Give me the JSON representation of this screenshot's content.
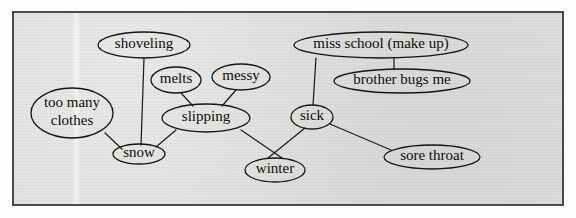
{
  "document": {
    "type": "concept-map",
    "title": "snow concept map",
    "background_color": "#dededc",
    "frame_color": "#4a4a48",
    "ink_color": "#141414"
  },
  "nodes": [
    {
      "id": "shoveling",
      "label": "shoveling",
      "cx": 144,
      "cy": 45,
      "rx": 46,
      "ry": 13,
      "font_size": 15
    },
    {
      "id": "melts",
      "label": "melts",
      "cx": 176,
      "cy": 80,
      "rx": 25,
      "ry": 13,
      "font_size": 15
    },
    {
      "id": "messy",
      "label": "messy",
      "cx": 241,
      "cy": 77,
      "rx": 29,
      "ry": 13,
      "font_size": 15
    },
    {
      "id": "too-many-clothes",
      "label": "too many clothes",
      "cx": 72,
      "cy": 113,
      "rx": 41,
      "ry": 25,
      "font_size": 15
    },
    {
      "id": "slipping",
      "label": "slipping",
      "cx": 206,
      "cy": 118,
      "rx": 44,
      "ry": 14,
      "font_size": 15
    },
    {
      "id": "snow",
      "label": "snow",
      "cx": 139,
      "cy": 154,
      "rx": 26,
      "ry": 10,
      "font_size": 15
    },
    {
      "id": "winter",
      "label": "winter",
      "cx": 275,
      "cy": 170,
      "rx": 30,
      "ry": 12,
      "font_size": 15
    },
    {
      "id": "miss-school",
      "label": "miss school (make up)",
      "cx": 381,
      "cy": 45,
      "rx": 87,
      "ry": 13,
      "font_size": 15
    },
    {
      "id": "brother-bugs-me",
      "label": "brother bugs me",
      "cx": 402,
      "cy": 81,
      "rx": 68,
      "ry": 12,
      "font_size": 15
    },
    {
      "id": "sick",
      "label": "sick",
      "cx": 312,
      "cy": 117,
      "rx": 21,
      "ry": 12,
      "font_size": 15
    },
    {
      "id": "sore-throat",
      "label": "sore throat",
      "cx": 432,
      "cy": 157,
      "rx": 48,
      "ry": 12,
      "font_size": 15
    }
  ],
  "node_label_lines": {
    "too-many-clothes": [
      "too many",
      "clothes"
    ]
  },
  "edges": [
    {
      "from": "shoveling",
      "to": "snow",
      "x1": 144,
      "y1": 58,
      "x2": 141,
      "y2": 145
    },
    {
      "from": "melts",
      "to": "slipping",
      "x1": 181,
      "y1": 93,
      "x2": 193,
      "y2": 106
    },
    {
      "from": "messy",
      "to": "slipping",
      "x1": 236,
      "y1": 90,
      "x2": 222,
      "y2": 106
    },
    {
      "from": "too-many-clothes",
      "to": "snow",
      "x1": 105,
      "y1": 133,
      "x2": 122,
      "y2": 149
    },
    {
      "from": "slipping",
      "to": "snow",
      "x1": 176,
      "y1": 130,
      "x2": 156,
      "y2": 147
    },
    {
      "from": "slipping",
      "to": "winter",
      "x1": 241,
      "y1": 130,
      "x2": 282,
      "y2": 158
    },
    {
      "from": "winter",
      "to": "sick",
      "x1": 268,
      "y1": 158,
      "x2": 305,
      "y2": 128
    },
    {
      "from": "miss-school",
      "to": "sick",
      "x1": 316,
      "y1": 58,
      "x2": 313,
      "y2": 105
    },
    {
      "from": "miss-school",
      "to": "brother-bugs-me",
      "x1": 394,
      "y1": 58,
      "x2": 394,
      "y2": 69
    },
    {
      "from": "sick",
      "to": "sore-throat",
      "x1": 330,
      "y1": 124,
      "x2": 391,
      "y2": 150
    }
  ],
  "legend": {
    "note": ""
  }
}
